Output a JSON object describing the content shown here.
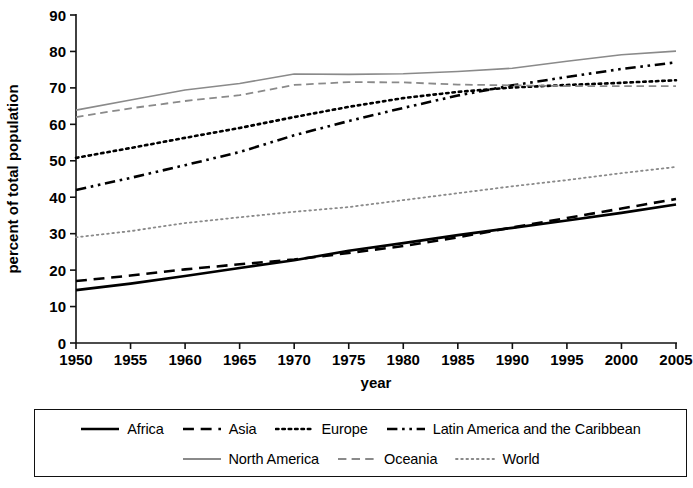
{
  "chart_data": {
    "type": "line",
    "title": "",
    "xlabel": "year",
    "ylabel": "percent of total population",
    "xlim": [
      1950,
      2005
    ],
    "ylim": [
      0,
      90
    ],
    "xticks": [
      1950,
      1955,
      1960,
      1965,
      1970,
      1975,
      1980,
      1985,
      1990,
      1995,
      2000,
      2005
    ],
    "yticks": [
      0,
      10,
      20,
      30,
      40,
      50,
      60,
      70,
      80,
      90
    ],
    "grid": false,
    "legend_position": "bottom",
    "x": [
      1950,
      1955,
      1960,
      1965,
      1970,
      1975,
      1980,
      1985,
      1990,
      1995,
      2000,
      2005
    ],
    "series": [
      {
        "name": "Africa",
        "style": "solid",
        "color": "#000000",
        "width": 2.6,
        "values": [
          14.5,
          16.3,
          18.4,
          20.6,
          22.7,
          25.3,
          27.4,
          29.6,
          31.6,
          33.6,
          35.7,
          38.0
        ]
      },
      {
        "name": "Asia",
        "style": "dashed",
        "color": "#000000",
        "width": 2.6,
        "values": [
          17.0,
          18.5,
          20.2,
          21.6,
          22.9,
          24.7,
          26.6,
          29.0,
          31.7,
          34.3,
          36.9,
          39.5
        ]
      },
      {
        "name": "Europe",
        "style": "dotted",
        "color": "#000000",
        "width": 2.6,
        "values": [
          50.8,
          53.5,
          56.3,
          59.0,
          62.0,
          64.8,
          67.2,
          68.9,
          70.1,
          70.8,
          71.4,
          72.1
        ]
      },
      {
        "name": "Latin America and the Caribbean",
        "style": "dashdotdot",
        "color": "#000000",
        "width": 2.6,
        "values": [
          42.0,
          45.3,
          48.8,
          52.4,
          57.0,
          60.9,
          64.5,
          67.9,
          70.7,
          73.0,
          75.2,
          77.0
        ]
      },
      {
        "name": "North America",
        "style": "solid",
        "color": "#8a8a8a",
        "width": 1.6,
        "values": [
          63.9,
          66.7,
          69.4,
          71.2,
          73.8,
          73.7,
          73.9,
          74.5,
          75.4,
          77.3,
          79.1,
          80.1
        ]
      },
      {
        "name": "Oceania",
        "style": "dashed",
        "color": "#8a8a8a",
        "width": 1.8,
        "values": [
          62.0,
          64.4,
          66.4,
          68.0,
          70.8,
          71.6,
          71.5,
          70.9,
          70.7,
          70.5,
          70.5,
          70.5
        ]
      },
      {
        "name": "World",
        "style": "finedotted",
        "color": "#8a8a8a",
        "width": 1.8,
        "values": [
          29.0,
          30.7,
          32.9,
          34.5,
          36.0,
          37.3,
          39.2,
          41.1,
          43.0,
          44.7,
          46.6,
          48.3
        ]
      }
    ]
  },
  "legend": {
    "rows": [
      [
        {
          "label": "Africa",
          "key": "solid-black"
        },
        {
          "label": "Asia",
          "key": "dashed-black"
        },
        {
          "label": "Europe",
          "key": "dotted-black"
        },
        {
          "label": "Latin America and the Caribbean",
          "key": "dashdotdot-black"
        }
      ],
      [
        {
          "label": "North America",
          "key": "solid-gray"
        },
        {
          "label": "Oceania",
          "key": "dashed-gray"
        },
        {
          "label": "World",
          "key": "finedotted-gray"
        }
      ]
    ]
  }
}
